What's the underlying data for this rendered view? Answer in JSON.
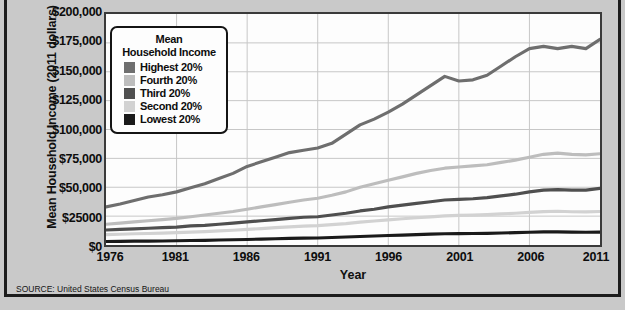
{
  "figure": {
    "y_axis_title": "Mean Household Income (2011 dollars)",
    "x_axis_title": "Year",
    "source_note": "SOURCE: United States Census Bureau",
    "background_color": "#c9c9c9",
    "plot_background_color": "#fdfdfd",
    "frame_color": "#1c1c1c"
  },
  "legend": {
    "title_line1": "Mean",
    "title_line2": "Household Income",
    "position": "inside-top-left",
    "entries": [
      {
        "label": "Highest 20%",
        "color": "#6e6e6e",
        "swatch_name": "swatch-highest"
      },
      {
        "label": "Fourth 20%",
        "color": "#bdbdbd",
        "swatch_name": "swatch-fourth"
      },
      {
        "label": "Third 20%",
        "color": "#4f4f4f",
        "swatch_name": "swatch-third"
      },
      {
        "label": "Second 20%",
        "color": "#d2d2d2",
        "swatch_name": "swatch-second"
      },
      {
        "label": "Lowest 20%",
        "color": "#1a1a1a",
        "swatch_name": "swatch-lowest"
      }
    ]
  },
  "chart_data": {
    "type": "line",
    "title": "",
    "subtitle": "",
    "xlabel": "Year",
    "ylabel": "Mean Household Income (2011 dollars)",
    "xlim": [
      1976,
      2011
    ],
    "ylim": [
      0,
      200000
    ],
    "grid": true,
    "legend_position": "inside-top-left",
    "x_tick_labels": [
      "1976",
      "1981",
      "1986",
      "1991",
      "1996",
      "2001",
      "2006",
      "2011"
    ],
    "x_tick_values": [
      1976,
      1981,
      1986,
      1991,
      1996,
      2001,
      2006,
      2011
    ],
    "y_tick_labels": [
      "$200,000",
      "$175,000",
      "$150,000",
      "$125,000",
      "$100,000",
      "$75,000",
      "$50,000",
      "$25000",
      "$0"
    ],
    "y_tick_values": [
      200000,
      175000,
      150000,
      125000,
      100000,
      75000,
      50000,
      25000,
      0
    ],
    "x": [
      1976,
      1977,
      1978,
      1979,
      1980,
      1981,
      1982,
      1983,
      1984,
      1985,
      1986,
      1987,
      1988,
      1989,
      1990,
      1991,
      1992,
      1993,
      1994,
      1995,
      1996,
      1997,
      1998,
      1999,
      2000,
      2001,
      2002,
      2003,
      2004,
      2005,
      2006,
      2007,
      2008,
      2009,
      2010,
      2011
    ],
    "series": [
      {
        "name": "Highest 20%",
        "color": "#6e6e6e",
        "values": [
          33000,
          35500,
          38500,
          41500,
          43500,
          46000,
          49500,
          53000,
          57500,
          62000,
          68000,
          72000,
          76000,
          80000,
          82000,
          84000,
          88000,
          96000,
          104000,
          109000,
          115000,
          122000,
          130000,
          138000,
          146000,
          142000,
          143000,
          147000,
          155000,
          163000,
          170000,
          172000,
          170000,
          172000,
          170000,
          178000
        ]
      },
      {
        "name": "Fourth 20%",
        "color": "#bdbdbd",
        "values": [
          18000,
          19000,
          20000,
          21000,
          22000,
          23000,
          24500,
          26000,
          27500,
          29000,
          31000,
          33000,
          35000,
          37000,
          39000,
          40500,
          43000,
          46000,
          50000,
          53000,
          56000,
          59000,
          62000,
          64500,
          66500,
          67500,
          68500,
          69500,
          71500,
          73500,
          76000,
          78500,
          79500,
          78500,
          78000,
          79000
        ]
      },
      {
        "name": "Third 20%",
        "color": "#4f4f4f",
        "values": [
          13000,
          13500,
          14000,
          14500,
          15000,
          15500,
          16500,
          17000,
          18000,
          19000,
          20000,
          21000,
          22000,
          23000,
          24000,
          24500,
          26000,
          27500,
          29500,
          31000,
          33000,
          34500,
          36000,
          37500,
          39000,
          39500,
          40000,
          41000,
          42500,
          44000,
          46000,
          47500,
          48000,
          47500,
          47500,
          49000
        ]
      },
      {
        "name": "Second 20%",
        "color": "#d2d2d2",
        "values": [
          9000,
          9300,
          9700,
          10000,
          10300,
          10700,
          11200,
          11600,
          12200,
          12800,
          13500,
          14200,
          15000,
          15700,
          16400,
          16800,
          17600,
          18500,
          19800,
          20800,
          21800,
          22700,
          23600,
          24400,
          25200,
          25600,
          25900,
          26300,
          26900,
          27500,
          28200,
          28900,
          29200,
          28800,
          28700,
          29000
        ]
      },
      {
        "name": "Lowest 20%",
        "color": "#1a1a1a",
        "values": [
          3000,
          3100,
          3300,
          3400,
          3500,
          3700,
          3900,
          4000,
          4300,
          4500,
          4800,
          5100,
          5400,
          5700,
          6000,
          6100,
          6500,
          6900,
          7400,
          7800,
          8200,
          8600,
          9000,
          9400,
          9700,
          9900,
          10000,
          10100,
          10400,
          10700,
          11000,
          11300,
          11400,
          11100,
          11000,
          11200
        ]
      }
    ]
  }
}
